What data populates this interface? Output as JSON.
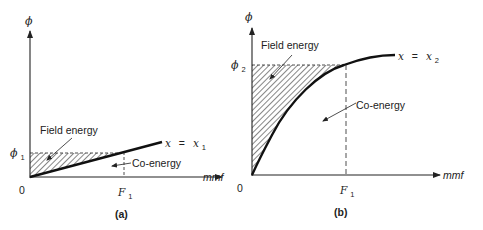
{
  "figure": {
    "panel_a": {
      "caption": "(a)",
      "y_axis_label": "ϕ",
      "x_axis_label": "mmf",
      "origin_label": "0",
      "phi_label": "ϕ",
      "phi_sub": "1",
      "f_label": "F",
      "f_sub": "1",
      "curve_label_lhs": "x",
      "curve_label_eq": "=",
      "curve_label_rhs": "x",
      "curve_label_sub": "1",
      "field_energy_label": "Field energy",
      "co_energy_label": "Co-energy"
    },
    "panel_b": {
      "caption": "(b)",
      "y_axis_label": "ϕ",
      "x_axis_label": "mmf",
      "origin_label": "0",
      "phi_label": "ϕ",
      "phi_sub": "2",
      "f_label": "F",
      "f_sub": "1",
      "curve_label_lhs": "x",
      "curve_label_eq": "=",
      "curve_label_rhs": "x",
      "curve_label_sub": "2",
      "field_energy_label": "Field energy",
      "co_energy_label": "Co-energy"
    },
    "colors": {
      "ink": "#222222",
      "background": "#ffffff"
    }
  }
}
